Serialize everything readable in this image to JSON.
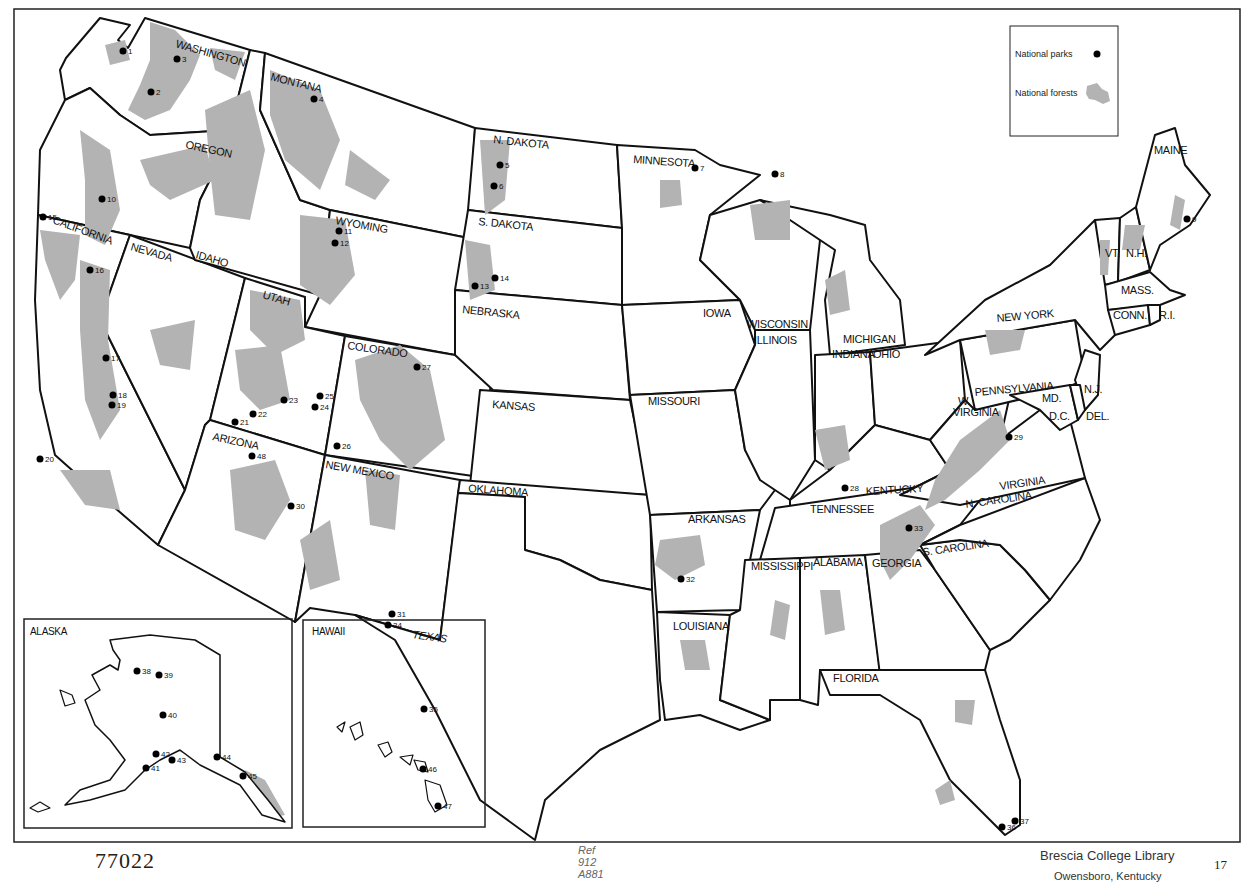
{
  "legend": {
    "parks_label": "National parks",
    "forests_label": "National forests",
    "parks_color": "#000000",
    "forests_color": "#b3b3b3"
  },
  "states": {
    "washington": "WASHINGTON",
    "oregon": "OREGON",
    "california": "CALIFORNIA",
    "nevada": "NEVADA",
    "idaho": "IDAHO",
    "montana": "MONTANA",
    "wyoming": "WYOMING",
    "utah": "UTAH",
    "colorado": "COLORADO",
    "arizona": "ARIZONA",
    "new_mexico": "NEW MEXICO",
    "n_dakota": "N. DAKOTA",
    "s_dakota": "S. DAKOTA",
    "nebraska": "NEBRASKA",
    "kansas": "KANSAS",
    "oklahoma": "OKLAHOMA",
    "texas": "TEXAS",
    "minnesota": "MINNESOTA",
    "iowa": "IOWA",
    "missouri": "MISSOURI",
    "arkansas": "ARKANSAS",
    "louisiana": "LOUISIANA",
    "wisconsin": "WISCONSIN",
    "illinois": "ILLINOIS",
    "michigan": "MICHIGAN",
    "indiana": "INDIANA",
    "ohio": "OHIO",
    "kentucky": "KENTUCKY",
    "tennessee": "TENNESSEE",
    "mississippi": "MISSISSIPPI",
    "alabama": "ALABAMA",
    "georgia": "GEORGIA",
    "florida": "FLORIDA",
    "s_carolina": "S. CAROLINA",
    "n_carolina": "N. CAROLINA",
    "virginia": "VIRGINIA",
    "w_virginia_1": "W.",
    "w_virginia_2": "VIRGINIA",
    "pennsylvania": "PENNSYLVANIA",
    "new_york": "NEW YORK",
    "maryland": "MD.",
    "dc": "D.C.",
    "delaware": "DEL.",
    "new_jersey": "N.J.",
    "connecticut": "CONN.",
    "rhode_island": "R.I.",
    "massachusetts": "MASS.",
    "vermont": "VT.",
    "new_hampshire": "N.H.",
    "maine": "MAINE",
    "alaska": "ALASKA",
    "hawaii": "HAWAII"
  },
  "parks": [
    {
      "n": "1",
      "x": 123,
      "y": 51
    },
    {
      "n": "2",
      "x": 151,
      "y": 92
    },
    {
      "n": "3",
      "x": 177,
      "y": 59
    },
    {
      "n": "4",
      "x": 314,
      "y": 99
    },
    {
      "n": "5",
      "x": 500,
      "y": 165
    },
    {
      "n": "6",
      "x": 494,
      "y": 186
    },
    {
      "n": "7",
      "x": 695,
      "y": 168
    },
    {
      "n": "8",
      "x": 775,
      "y": 174
    },
    {
      "n": "9",
      "x": 1187,
      "y": 219
    },
    {
      "n": "10",
      "x": 102,
      "y": 199
    },
    {
      "n": "11",
      "x": 339,
      "y": 231
    },
    {
      "n": "12",
      "x": 335,
      "y": 243
    },
    {
      "n": "13",
      "x": 475,
      "y": 286
    },
    {
      "n": "14",
      "x": 495,
      "y": 278
    },
    {
      "n": "15",
      "x": 43,
      "y": 217
    },
    {
      "n": "16",
      "x": 90,
      "y": 270
    },
    {
      "n": "17",
      "x": 106,
      "y": 358
    },
    {
      "n": "18",
      "x": 113,
      "y": 395
    },
    {
      "n": "19",
      "x": 112,
      "y": 405
    },
    {
      "n": "20",
      "x": 40,
      "y": 459
    },
    {
      "n": "21",
      "x": 235,
      "y": 422
    },
    {
      "n": "22",
      "x": 253,
      "y": 414
    },
    {
      "n": "23",
      "x": 284,
      "y": 400
    },
    {
      "n": "24",
      "x": 315,
      "y": 407
    },
    {
      "n": "25",
      "x": 320,
      "y": 396
    },
    {
      "n": "26",
      "x": 337,
      "y": 446
    },
    {
      "n": "27",
      "x": 417,
      "y": 367
    },
    {
      "n": "28",
      "x": 845,
      "y": 488
    },
    {
      "n": "29",
      "x": 1009,
      "y": 437
    },
    {
      "n": "30",
      "x": 291,
      "y": 506
    },
    {
      "n": "31",
      "x": 392,
      "y": 614
    },
    {
      "n": "32",
      "x": 681,
      "y": 579
    },
    {
      "n": "33",
      "x": 909,
      "y": 528
    },
    {
      "n": "34",
      "x": 388,
      "y": 625
    },
    {
      "n": "35",
      "x": 424,
      "y": 709
    },
    {
      "n": "36",
      "x": 1002,
      "y": 827
    },
    {
      "n": "37",
      "x": 1015,
      "y": 821
    },
    {
      "n": "38",
      "x": 137,
      "y": 671
    },
    {
      "n": "39",
      "x": 159,
      "y": 675
    },
    {
      "n": "40",
      "x": 163,
      "y": 715
    },
    {
      "n": "41",
      "x": 146,
      "y": 768
    },
    {
      "n": "42",
      "x": 156,
      "y": 754
    },
    {
      "n": "43",
      "x": 172,
      "y": 760
    },
    {
      "n": "44",
      "x": 217,
      "y": 757
    },
    {
      "n": "45",
      "x": 243,
      "y": 776
    },
    {
      "n": "46",
      "x": 423,
      "y": 769
    },
    {
      "n": "47",
      "x": 438,
      "y": 806
    },
    {
      "n": "48",
      "x": 252,
      "y": 456
    }
  ],
  "footer": {
    "catalog_number": "77022",
    "ref_call": "Ref\n912\nA881",
    "library": "Brescia College Library",
    "city": "Owensboro, Kentucky",
    "page_number": "17"
  }
}
